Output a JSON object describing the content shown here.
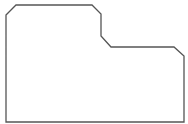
{
  "shape": {
    "type": "outline-polygon",
    "stroke": "#555555",
    "fill": "#ffffff",
    "stroke_width": 1.3,
    "points": "6,15 16,5 92,5 101,14 101,36 111,47 174,47 184,56 184,122 6,122"
  }
}
